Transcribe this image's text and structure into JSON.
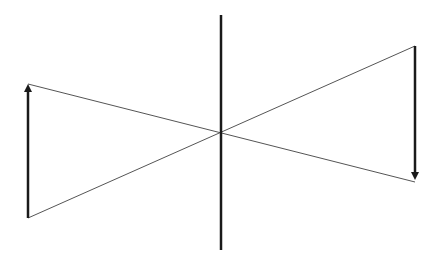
{
  "diagram": {
    "type": "ray-diagram",
    "background": "#ffffff",
    "stroke_color": "#1a1a1a",
    "ray_color": "#555555",
    "lens_axis": {
      "x": 221,
      "y1": 15,
      "y2": 250
    },
    "object_arrow": {
      "x": 28,
      "y_base": 218,
      "y_tip": 82,
      "direction": "up"
    },
    "image_arrow": {
      "x": 415,
      "y_base": 46,
      "y_tip": 182,
      "direction": "down"
    },
    "rays": [
      {
        "x1": 28,
        "y1": 84,
        "x2": 415,
        "y2": 182
      },
      {
        "x1": 28,
        "y1": 218,
        "x2": 415,
        "y2": 46
      }
    ]
  }
}
